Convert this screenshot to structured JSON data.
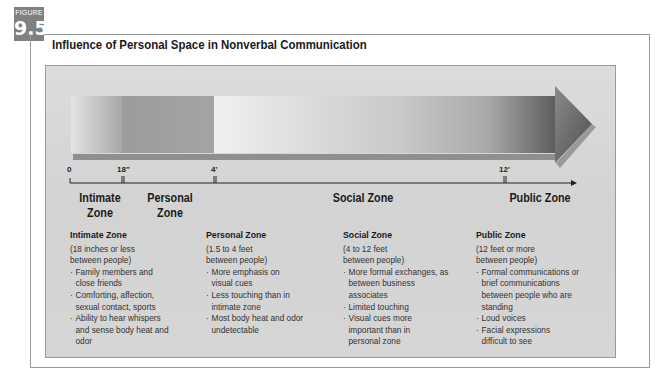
{
  "figure": {
    "label": "FIGURE",
    "number": "9.5",
    "title": "Influence of Personal Space in Nonverbal Communication"
  },
  "colors": {
    "badge": "#808080",
    "panel": "#d6d6d6",
    "intimate_bar": "#a9a9a9",
    "personal_bar": "#9c9c9c",
    "social_bar": "#e6e6e6",
    "arrow_head": "#5a5a5a"
  },
  "scale": {
    "ticks": [
      {
        "label": "0"
      },
      {
        "label": "18\""
      },
      {
        "label": "4'"
      },
      {
        "label": "12'"
      }
    ]
  },
  "zones": [
    {
      "short_label_line1": "Intimate",
      "short_label_line2": "Zone",
      "heading": "Intimate Zone",
      "range_line1": "(18 inches or less",
      "range_line2": "between people)",
      "bullets": [
        "Family members and close friends",
        "Comforting, affection, sexual contact, sports",
        "Ability to hear whispers and sense body heat and odor"
      ]
    },
    {
      "short_label_line1": "Personal",
      "short_label_line2": "Zone",
      "heading": "Personal Zone",
      "range_line1": "(1.5 to 4 feet",
      "range_line2": "between people)",
      "bullets": [
        "More emphasis on visual cues",
        "Less touching than in intimate zone",
        "Most body heat and odor undetectable"
      ]
    },
    {
      "short_label": "Social Zone",
      "heading": "Social Zone",
      "range_line1": "(4 to 12 feet",
      "range_line2": "between people)",
      "bullets": [
        "More formal exchanges, as between business associates",
        "Limited touching",
        "Visual cues more important than in personal zone"
      ]
    },
    {
      "short_label": "Public Zone",
      "heading": "Public Zone",
      "range_line1": "(12 feet or more",
      "range_line2": "between people)",
      "bullets": [
        "Formal communications or brief communications between people who are standing",
        "Loud voices",
        "Facial expressions difficult to see"
      ]
    }
  ]
}
